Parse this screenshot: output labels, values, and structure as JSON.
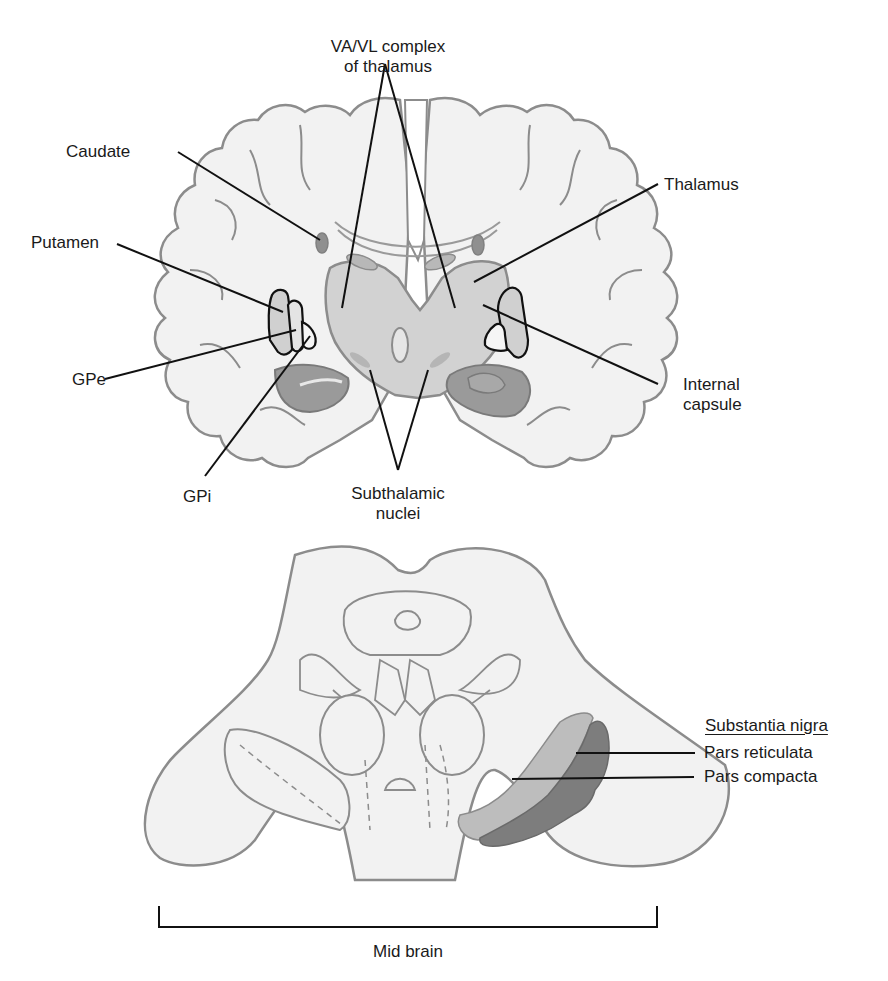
{
  "figure": {
    "coronal_section": {
      "labels": {
        "va_vl_line1": "VA/VL complex",
        "va_vl_line2": "of thalamus",
        "caudate": "Caudate",
        "thalamus": "Thalamus",
        "putamen": "Putamen",
        "gpe": "GPe",
        "internal_capsule_line1": "Internal",
        "internal_capsule_line2": "capsule",
        "gpi": "GPi",
        "subthalamic_line1": "Subthalamic",
        "subthalamic_line2": "nuclei"
      }
    },
    "midbrain_section": {
      "labels": {
        "substantia_nigra": "Substantia nigra",
        "pars_reticulata": "Pars reticulata",
        "pars_compacta": "Pars compacta",
        "mid_brain": "Mid brain"
      }
    },
    "colors": {
      "tissue_fill": "#f2f2f2",
      "outline": "#8c8c8c",
      "thalamus_fill": "#d2d2d2",
      "nucleus_dark": "#8f8f8f",
      "nucleus_mid": "#a8a8a8",
      "pars_compacta": "#bdbdbd",
      "pars_reticulata": "#7d7d7d",
      "leader_line": "#111111"
    }
  }
}
